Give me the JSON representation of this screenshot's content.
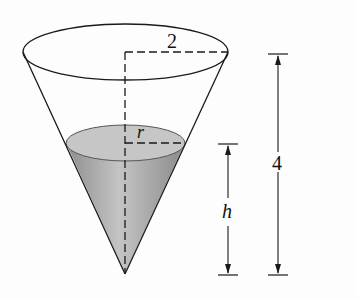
{
  "figure": {
    "type": "cone-with-water",
    "labels": {
      "top_radius": "2",
      "water_radius": "r",
      "water_height": "h",
      "total_height": "4"
    },
    "colors": {
      "line": "#1a1a1a",
      "water_fill": "#a9a9a9",
      "water_surface": "#c8c8c8",
      "background": "#fdfdfd"
    }
  }
}
